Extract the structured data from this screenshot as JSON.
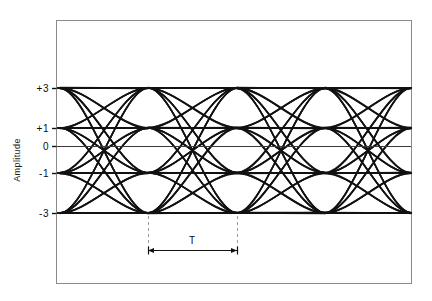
{
  "figure": {
    "kind": "eye-diagram",
    "background_color": "#ffffff",
    "frame": {
      "x": 56,
      "y": 20,
      "width": 355,
      "height": 263,
      "stroke_color": "#8a8a8a",
      "stroke_width": 1
    },
    "trace_color": "#111111",
    "axis_line_color": "#3a3a3a",
    "dashed_color": "#9a9a9a"
  },
  "axes": {
    "y_axis_title": "Amplitude",
    "y_tick_labels": [
      "+3",
      "+1",
      "0",
      "-1",
      "-3"
    ],
    "y_tick_values": [
      3,
      1,
      0,
      -1,
      -3
    ],
    "y_tick_pixel_y": [
      88,
      128,
      146,
      173,
      213
    ],
    "x_axis_title": "",
    "x_tick_labels": []
  },
  "annotations": {
    "period_label": "T",
    "period_label_x": 192,
    "period_label_y": 240,
    "dimension_line_y": 250,
    "dimension_left_x": 148,
    "dimension_right_x": 237,
    "dashed_top_y": 216,
    "dashed_bottom_y": 250
  },
  "chart_data": {
    "type": "line",
    "title": "",
    "xlabel": "",
    "ylabel": "Amplitude",
    "grid": false,
    "legend": "none",
    "levels": [
      3,
      1,
      -1,
      -3
    ],
    "level_labels": [
      "+3",
      "+1",
      "-1",
      "-3"
    ],
    "zero_reference": 0,
    "ylim": [
      -4.4,
      5.2
    ],
    "xlim": [
      0,
      4
    ],
    "symbol_period_T": 1,
    "symbol_period_pixels": 88.5,
    "number_of_eyes_visible": 4,
    "crossing_pixel_x": [
      60,
      148,
      237,
      325,
      411
    ],
    "eye_center_pixel_x": [
      104,
      192,
      281,
      369
    ],
    "transition_sequences": [
      [
        3,
        3
      ],
      [
        3,
        1
      ],
      [
        3,
        -1
      ],
      [
        3,
        -3
      ],
      [
        1,
        3
      ],
      [
        1,
        1
      ],
      [
        1,
        -1
      ],
      [
        1,
        -3
      ],
      [
        -1,
        3
      ],
      [
        -1,
        1
      ],
      [
        -1,
        -1
      ],
      [
        -1,
        -3
      ],
      [
        -3,
        3
      ],
      [
        -3,
        1
      ],
      [
        -3,
        -1
      ],
      [
        -3,
        -3
      ]
    ],
    "traces_per_eye": 16,
    "overlay_jitter": 0.9,
    "annotation": "T"
  }
}
